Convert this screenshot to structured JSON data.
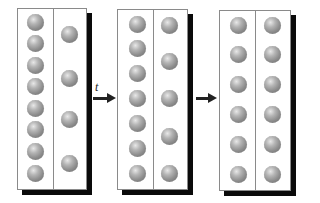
{
  "diagram": {
    "arrow_label": "t",
    "colors": {
      "ball": "#9a9a9a",
      "border": "#8a8a8a",
      "shadow": "#0a0a0a"
    },
    "panels": [
      {
        "name": "initial",
        "left_count": 8,
        "right_count": 4
      },
      {
        "name": "intermediate",
        "left_count": 7,
        "right_count": 5
      },
      {
        "name": "equilibrium",
        "left_count": 6,
        "right_count": 6
      }
    ]
  }
}
